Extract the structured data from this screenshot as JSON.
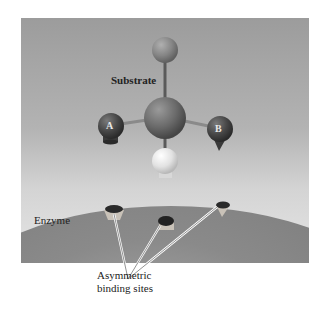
{
  "labels": {
    "substrate": "Substrate",
    "enzyme": "Enzyme",
    "atom_a": "A",
    "atom_b": "B",
    "caption_line1": "Asymmetric",
    "caption_line2": "binding sites"
  },
  "colors": {
    "background_top": "#9c9c9c",
    "background_bottom": "#e6e6e6",
    "central_atom": "#6e6e6e",
    "top_atom": "#8a8a8a",
    "atom_a": "#4a4a4a",
    "atom_b": "#4a4a4a",
    "bottom_atom": "#e8e8e8",
    "enzyme_surface": "#8a8a8a",
    "binding_site": "#2a2a2a"
  }
}
